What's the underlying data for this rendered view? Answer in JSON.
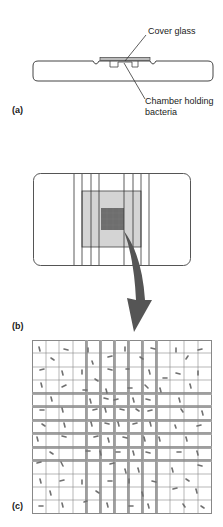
{
  "panels": {
    "a": {
      "label": "(a)",
      "callouts": {
        "cover_glass": "Cover glass",
        "chamber_line1": "Chamber holding",
        "chamber_line2": "bacteria"
      }
    },
    "b": {
      "label": "(b)"
    },
    "c": {
      "label": "(c)",
      "grid_columns": 13,
      "grid_rows": 13
    }
  },
  "colors": {
    "line": "#444444",
    "slide_fill": "#ffffff",
    "counting_area": "#d4d4d4",
    "center_square": "#6e6e6e",
    "arrow": "#555555",
    "bacteria": "#707070",
    "triple_line": "#9a9a9a"
  }
}
